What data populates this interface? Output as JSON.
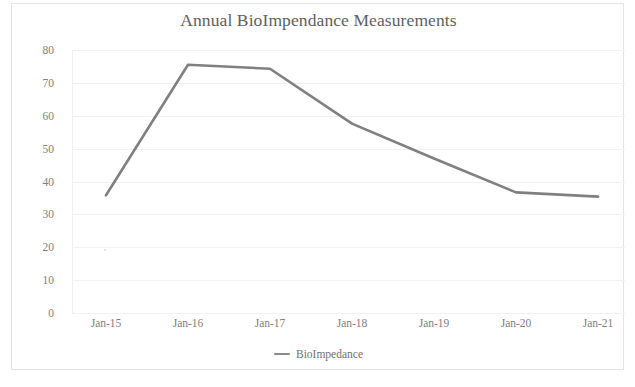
{
  "chart_data": {
    "type": "line",
    "title": "Annual BioImpendance Measurements",
    "xlabel": "",
    "ylabel": "",
    "categories": [
      "Jan-15",
      "Jan-16",
      "Jan-17",
      "Jan-18",
      "Jan-19",
      "Jan-20",
      "Jan-21"
    ],
    "series": [
      {
        "name": "BioImpedance",
        "values": [
          35.8,
          75.5,
          74.3,
          57.6,
          47.0,
          36.7,
          35.4
        ],
        "color": "#808080"
      }
    ],
    "ylim": [
      0,
      80
    ],
    "yticks": [
      80,
      70,
      60,
      50,
      40,
      30,
      20,
      10,
      0
    ],
    "ytick_labels": [
      "80",
      "70",
      "60",
      "50",
      "40",
      "30",
      "20",
      "10",
      "0"
    ],
    "grid": true,
    "grid_axis": "y",
    "legend": true,
    "legend_position": "bottom",
    "legend_entries": [
      "BioImpedance"
    ],
    "line_color": "#808080",
    "grid_color": "#f1f1f1",
    "title_color": "#5f5f5f",
    "tick_label_color": "#808080",
    "background_color": "#ffffff",
    "border_color": "#e4e4e4"
  }
}
